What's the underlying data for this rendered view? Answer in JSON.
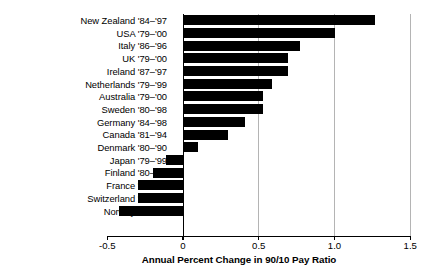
{
  "chart_data": {
    "type": "bar",
    "orientation": "horizontal",
    "title": "",
    "xlabel": "Annual Percent Change in 90/10 Pay Ratio",
    "ylabel": "",
    "xlim": [
      -0.5,
      1.5
    ],
    "xticks": [
      "-0.5",
      "0",
      "0.5",
      "1.0",
      "1.5"
    ],
    "xtick_values": [
      -0.5,
      0,
      0.5,
      1.0,
      1.5
    ],
    "grid": true,
    "grid_axis": "x",
    "legend": "none",
    "bar_color": "#000000",
    "categories": [
      "New Zealand '84–'97",
      "USA '79–'00",
      "Italy '86–'96",
      "UK '79–'00",
      "Ireland '87–'97",
      "Netherlands '79–'99",
      "Australia '79–'00",
      "Sweden '80–'98",
      "Germany '84–'98",
      "Canada '81–'94",
      "Denmark '80–'90",
      "Japan '79–'99",
      "Finland '80–'99",
      "France '79–'98",
      "Switzerland '91–'98",
      "Norway '80–'91"
    ],
    "values": [
      1.27,
      1.0,
      0.77,
      0.69,
      0.69,
      0.59,
      0.53,
      0.53,
      0.41,
      0.3,
      0.1,
      -0.11,
      -0.2,
      -0.3,
      -0.3,
      -0.42
    ]
  }
}
